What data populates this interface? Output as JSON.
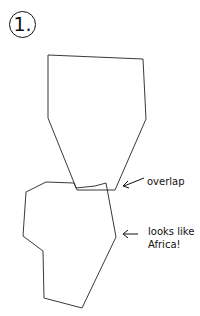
{
  "figure": {
    "number_label": "1.",
    "annotations": [
      {
        "id": "overlap",
        "text": "overlap",
        "x": 132,
        "y": 174
      },
      {
        "id": "africa-line1",
        "text": "looks like",
        "x": 147,
        "y": 222
      },
      {
        "id": "africa-line2",
        "text": "Africa!",
        "x": 147,
        "y": 235
      }
    ],
    "shapes": {
      "top_polygon": "48,55 143,59 146,119 115,190 77,190 48,118",
      "bottom_polygon": "26,192 46,182 74,183 76,188 95,186 106,183 116,237 82,308 44,298 43,251 23,236",
      "stroke_color": "#222222"
    }
  }
}
